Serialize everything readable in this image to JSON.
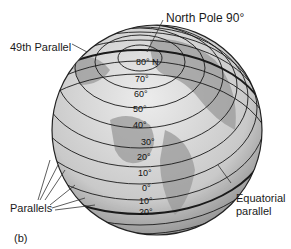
{
  "labels": {
    "north_pole": "North Pole  90°",
    "parallel_49": "49th Parallel",
    "parallels": "Parallels",
    "equatorial_1": "Equatorial",
    "equatorial_2": "parallel",
    "figure_tag": "(b)"
  },
  "degrees": [
    {
      "text": "80° N",
      "x": 136,
      "y": 61
    },
    {
      "text": "70°",
      "x": 135,
      "y": 78
    },
    {
      "text": "60°",
      "x": 134,
      "y": 93
    },
    {
      "text": "50°",
      "x": 133,
      "y": 108
    },
    {
      "text": "40°",
      "x": 133,
      "y": 124
    },
    {
      "text": "30°",
      "x": 141,
      "y": 141
    },
    {
      "text": "20°",
      "x": 137,
      "y": 156
    },
    {
      "text": "10°",
      "x": 138,
      "y": 172
    },
    {
      "text": "0°",
      "x": 142,
      "y": 187
    },
    {
      "text": "10°",
      "x": 139,
      "y": 200
    },
    {
      "text": "20°",
      "x": 139,
      "y": 211
    }
  ],
  "colors": {
    "ocean": "#d9d9d9",
    "land": "#9a9a9a",
    "lines": "#1a1a1a"
  }
}
